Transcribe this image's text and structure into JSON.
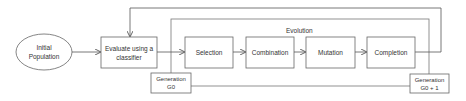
{
  "diagram": {
    "nodes": {
      "initial_population": {
        "label": "Initial Population"
      },
      "evaluate": {
        "label": "Evaluate using a classifier"
      },
      "selection": {
        "label": "Selection"
      },
      "combination": {
        "label": "Combination"
      },
      "mutation": {
        "label": "Mutation"
      },
      "completion": {
        "label": "Completion"
      },
      "generation_g0": {
        "label": "Generation G0"
      },
      "generation_g0_plus_1": {
        "label": "Generation G0 + 1"
      }
    },
    "group": {
      "label": "Evolution"
    },
    "edges": [
      {
        "from": "Initial Population",
        "to": "Evaluate using a classifier"
      },
      {
        "from": "Evaluate using a classifier",
        "to": "Selection"
      },
      {
        "from": "Selection",
        "to": "Combination"
      },
      {
        "from": "Combination",
        "to": "Mutation"
      },
      {
        "from": "Mutation",
        "to": "Completion"
      },
      {
        "from": "Completion",
        "to": "Evaluate using a classifier",
        "type": "feedback"
      }
    ],
    "colors": {
      "stroke": "#555555",
      "fill": "#ffffff",
      "text": "#333333"
    }
  }
}
